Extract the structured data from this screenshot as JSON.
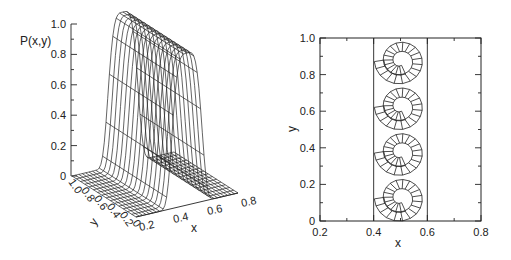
{
  "chart_data": [
    {
      "type": "surface3d",
      "title": "",
      "zlabel": "P(x,y)",
      "xlabel": "x",
      "ylabel": "y",
      "z_ticks": [
        "0",
        "0.2",
        "0.4",
        "0.6",
        "0.8",
        "1.0"
      ],
      "x_ticks": [
        "0.2",
        "0.4",
        "0.6",
        "0.8"
      ],
      "y_ticks": [
        "0",
        "0.2",
        "0.4",
        "0.6",
        "0.8",
        "1.0"
      ],
      "zlim": [
        0,
        1.0
      ],
      "xlim": [
        0.2,
        0.8
      ],
      "ylim": [
        0,
        1.0
      ],
      "description": "Wireframe surface: a ridge of height ~1.0 centered near x=0.5, uniform along y, dropping to 0 away from the strip 0.4<x<0.6",
      "ridge": {
        "x_center": 0.5,
        "half_width": 0.1,
        "peak": 1.0
      }
    },
    {
      "type": "contour",
      "title": "",
      "xlabel": "x",
      "ylabel": "y",
      "x_ticks": [
        "0.2",
        "0.4",
        "0.6",
        "0.8"
      ],
      "y_ticks": [
        "0",
        "0.2",
        "0.4",
        "0.6",
        "0.8",
        "1.0"
      ],
      "xlim": [
        0.2,
        0.8
      ],
      "ylim": [
        0,
        1.0
      ],
      "grid": false,
      "strip": {
        "x_min": 0.4,
        "x_max": 0.6
      },
      "description": "Meandering hatched band pattern (spiral motifs) confined to the strip 0.4 ≤ x ≤ 0.6, repeating with period ~0.25 in y"
    }
  ]
}
